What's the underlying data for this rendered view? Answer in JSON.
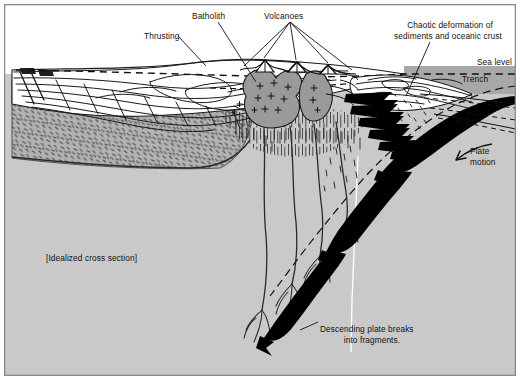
{
  "diagram": {
    "title_note": "[Idealized cross section]",
    "labels": {
      "thrusting": "Thrusting",
      "batholith": "Batholith",
      "volcanoes": "Volcanoes",
      "chaotic_line1": "Chaotic deformation of",
      "chaotic_line2": "sediments and oceanic crust",
      "sea_level": "Sea level",
      "trench": "Trench",
      "plate_motion_line1": "Plate",
      "plate_motion_line2": "motion",
      "descending_line1": "Descending plate breaks",
      "descending_line2": "into fragments."
    },
    "colors": {
      "frame_border": "#8a8a8a",
      "mantle_gray": "#c9c9c9",
      "crust_gray": "#b2b2b2",
      "ocean_gray": "#a8a8a8",
      "magma_gray": "#9a9a9a",
      "plate_black": "#000000",
      "paper_white": "#ffffff",
      "ink": "#111111",
      "white_line": "#ffffff"
    },
    "icons": {
      "plate_motion_arrow": "curved-arrow-icon",
      "volcano_leaders": "leader-lines-icon",
      "sea_level_dashes": "dashed-line-icon"
    },
    "features": {
      "continental_crust": "stippled-dash-texture",
      "thrust_sheets": "folded-thrust-layers",
      "batholiths": "two-plutons-with-plus-symbols",
      "volcano_count": 3,
      "subduction_fragments": "black-wedge-fragments",
      "melt_plumes": 4
    }
  }
}
